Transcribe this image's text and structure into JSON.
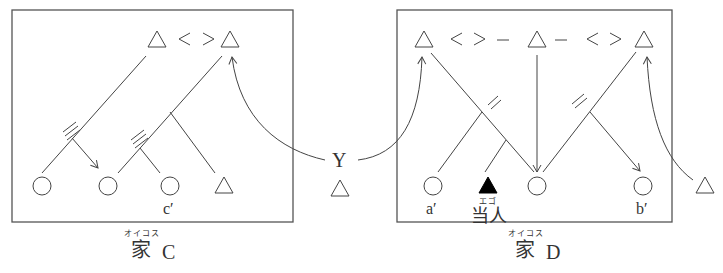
{
  "households": [
    {
      "id": "C",
      "caption_kanji": "家",
      "caption_letter": "C",
      "caption_furigana": "オイコス",
      "top_row": [
        "△",
        "<>",
        "△"
      ],
      "bottom_row": [
        "○",
        "○",
        "○",
        "△"
      ],
      "labels": {
        "c_prime": "c′"
      }
    },
    {
      "id": "D",
      "caption_kanji": "家",
      "caption_letter": "D",
      "caption_furigana": "オイコス",
      "top_row": [
        "△",
        "<",
        ">",
        "–",
        "△",
        "–",
        "<",
        ">",
        "△"
      ],
      "bottom_row": [
        "○",
        "▲",
        "○",
        "○"
      ],
      "labels": {
        "a_prime": "a′",
        "b_prime": "b′",
        "ego": "当人",
        "ego_furigana": "エゴ"
      }
    }
  ],
  "outside": {
    "y_label": "Y",
    "y_symbol": "△",
    "right_symbol": "△"
  },
  "colors": {
    "line": "#444444",
    "ego_fill": "#000000"
  }
}
